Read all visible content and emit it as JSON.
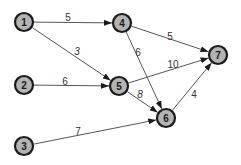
{
  "diagram": {
    "type": "directed-weighted-graph",
    "colors": {
      "node_fill": "#b3b3b3",
      "node_stroke": "#1a1a1a",
      "edge": "#555555",
      "label": "#333333",
      "background": "#ffffff"
    },
    "nodes": [
      {
        "id": "1",
        "label": "1",
        "x": 24,
        "y": 22
      },
      {
        "id": "2",
        "label": "2",
        "x": 24,
        "y": 85
      },
      {
        "id": "3",
        "label": "3",
        "x": 24,
        "y": 146
      },
      {
        "id": "4",
        "label": "4",
        "x": 122,
        "y": 23
      },
      {
        "id": "5",
        "label": "5",
        "x": 119,
        "y": 86
      },
      {
        "id": "6",
        "label": "6",
        "x": 166,
        "y": 118
      },
      {
        "id": "7",
        "label": "7",
        "x": 218,
        "y": 55
      }
    ],
    "edges": [
      {
        "from": "1",
        "to": "4",
        "weight": "5",
        "lx": 68,
        "ly": 17,
        "italic": false
      },
      {
        "from": "1",
        "to": "5",
        "weight": "3",
        "lx": 77,
        "ly": 51,
        "italic": true
      },
      {
        "from": "2",
        "to": "5",
        "weight": "6",
        "lx": 65,
        "ly": 81,
        "italic": false
      },
      {
        "from": "4",
        "to": "7",
        "weight": "5",
        "lx": 170,
        "ly": 36,
        "italic": false
      },
      {
        "from": "4",
        "to": "6",
        "weight": "6",
        "lx": 138,
        "ly": 52,
        "italic": false
      },
      {
        "from": "5",
        "to": "7",
        "weight": "10",
        "lx": 173,
        "ly": 64,
        "italic": false
      },
      {
        "from": "5",
        "to": "6",
        "weight": "8",
        "lx": 140,
        "ly": 94,
        "italic": true
      },
      {
        "from": "3",
        "to": "6",
        "weight": "7",
        "lx": 78,
        "ly": 131,
        "italic": false
      },
      {
        "from": "6",
        "to": "7",
        "weight": "4",
        "lx": 194,
        "ly": 94,
        "italic": false
      }
    ]
  }
}
